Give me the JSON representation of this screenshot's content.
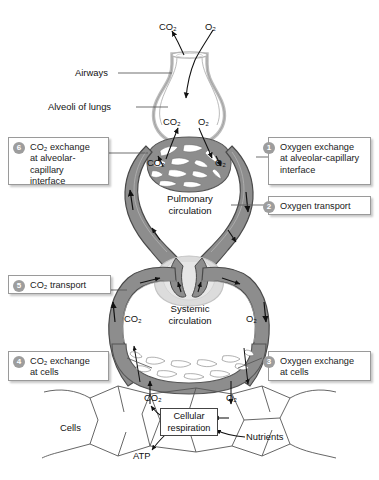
{
  "anatomy_labels": {
    "airways": "Airways",
    "alveoli": "Alveoli of lungs",
    "pulmonary_circulation": "Pulmonary\ncirculation",
    "systemic_circulation": "Systemic\ncirculation",
    "cells": "Cells",
    "nutrients": "Nutrients",
    "atp": "ATP",
    "cellular_respiration": "Cellular\nrespiration"
  },
  "gas_labels": {
    "co2_exhaled": "CO₂",
    "o2_inhaled": "O₂",
    "co2_alveolus": "CO₂",
    "o2_alveolus": "O₂",
    "co2_pulm_capillary": "CO₂",
    "o2_pulm_capillary": "O₂",
    "co2_systemic": "CO₂",
    "o2_systemic": "O₂",
    "co2_cell": "CO₂",
    "o2_cell": "O₂"
  },
  "callouts": [
    {
      "number": "1",
      "text": "Oxygen exchange\nat alveolar-capillary\ninterface",
      "side": "right"
    },
    {
      "number": "2",
      "text": "Oxygen transport",
      "side": "right"
    },
    {
      "number": "3",
      "text": "Oxygen exchange\nat cells",
      "side": "right"
    },
    {
      "number": "4",
      "text": "CO₂ exchange\nat cells",
      "side": "left"
    },
    {
      "number": "5",
      "text": "CO₂ transport",
      "side": "left"
    },
    {
      "number": "6",
      "text": "CO₂ exchange\nat alveolar-capillary\ninterface",
      "side": "left"
    }
  ],
  "colors": {
    "vessel_fill": "#8d8d8d",
    "vessel_stroke": "#4a4a4a",
    "vessel_light": "#bdbdbd",
    "alveolus_fill": "#ffffff",
    "alveolus_wall": "#d3d3d3",
    "heart_fill": "#dcdcdc",
    "callout_border": "#9a9a9a",
    "badge_fill": "#9d9d9d",
    "text": "#111111",
    "leader_line": "#555555",
    "background": "#ffffff"
  }
}
